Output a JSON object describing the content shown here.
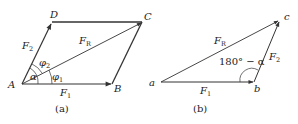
{
  "diagram_a": {
    "caption": "(a)",
    "points": {
      "A": {
        "label": "A",
        "x": 22,
        "y": 84
      },
      "B": {
        "label": "B",
        "x": 112,
        "y": 84
      },
      "C": {
        "label": "C",
        "x": 142,
        "y": 22
      },
      "D": {
        "label": "D",
        "x": 52,
        "y": 22
      }
    },
    "vectors": {
      "F1": {
        "label": "F",
        "sub": "1"
      },
      "F2": {
        "label": "F",
        "sub": "2"
      },
      "FR": {
        "label": "F",
        "sub": "R"
      }
    },
    "angles": {
      "alpha": "α",
      "phi1": {
        "label": "φ",
        "sub": "1"
      },
      "phi2": {
        "label": "φ",
        "sub": "2"
      }
    }
  },
  "diagram_b": {
    "caption": "(b)",
    "points": {
      "a": {
        "label": "a",
        "x": 161,
        "y": 82
      },
      "b": {
        "label": "b",
        "x": 254,
        "y": 82
      },
      "c": {
        "label": "c",
        "x": 280,
        "y": 20
      }
    },
    "vectors": {
      "F1": {
        "label": "F",
        "sub": "1"
      },
      "F2": {
        "label": "F",
        "sub": "2"
      },
      "FR": {
        "label": "F",
        "sub": "R"
      }
    },
    "angle_label": "180° − α"
  },
  "colors": {
    "line": "#333333",
    "text": "#222222"
  }
}
